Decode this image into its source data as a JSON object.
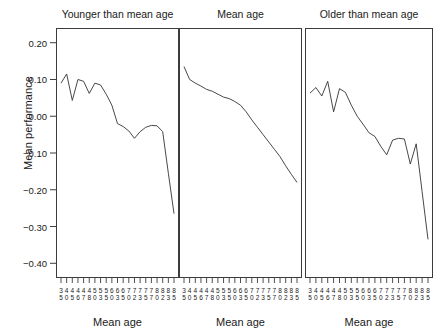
{
  "figure": {
    "ylabel": "Mean performance",
    "xlabel": "Mean age",
    "y_ticks": [
      "0.20",
      "0.10",
      "0.00",
      "-0.10",
      "-0.20",
      "-0.30",
      "-0.40"
    ],
    "x_ticks": [
      "35",
      "40",
      "45",
      "46",
      "47",
      "48",
      "50",
      "53",
      "55",
      "60",
      "63",
      "65",
      "70",
      "72",
      "73",
      "75",
      "77",
      "80",
      "82",
      "83",
      "85"
    ],
    "line_color": "#333333",
    "frame_color": "#3c3c3c",
    "background": "#ffffff"
  },
  "chart_data": [
    {
      "type": "line",
      "title": "Younger than mean age",
      "xlabel": "Mean age",
      "ylabel": "Mean performance",
      "ylim": [
        -0.44,
        0.24
      ],
      "grid": false,
      "legend": null,
      "x": [
        "35",
        "40",
        "45",
        "46",
        "47",
        "48",
        "50",
        "53",
        "55",
        "60",
        "63",
        "65",
        "70",
        "72",
        "73",
        "75",
        "77",
        "80",
        "82",
        "83",
        "85"
      ],
      "categories": [
        "35",
        "40",
        "45",
        "46",
        "47",
        "48",
        "50",
        "53",
        "55",
        "60",
        "63",
        "65",
        "70",
        "72",
        "73",
        "75",
        "77",
        "80",
        "82",
        "83",
        "85"
      ],
      "values": [
        0.09,
        0.115,
        0.043,
        0.1,
        0.095,
        0.062,
        0.09,
        0.085,
        0.06,
        0.03,
        -0.02,
        -0.028,
        -0.04,
        -0.06,
        -0.042,
        -0.03,
        -0.025,
        -0.026,
        -0.042,
        -0.155,
        -0.265
      ]
    },
    {
      "type": "line",
      "title": "Mean age",
      "xlabel": "Mean age",
      "ylabel": "Mean performance",
      "ylim": [
        -0.44,
        0.24
      ],
      "grid": false,
      "legend": null,
      "x": [
        "35",
        "40",
        "45",
        "46",
        "47",
        "48",
        "50",
        "53",
        "55",
        "60",
        "63",
        "65",
        "70",
        "72",
        "73",
        "75",
        "77",
        "80",
        "82",
        "83",
        "85"
      ],
      "categories": [
        "35",
        "40",
        "45",
        "46",
        "47",
        "48",
        "50",
        "53",
        "55",
        "60",
        "63",
        "65",
        "70",
        "72",
        "73",
        "75",
        "77",
        "80",
        "82",
        "83",
        "85"
      ],
      "values": [
        0.135,
        0.1,
        0.09,
        0.082,
        0.073,
        0.068,
        0.06,
        0.052,
        0.048,
        0.04,
        0.03,
        0.012,
        -0.01,
        -0.03,
        -0.05,
        -0.07,
        -0.09,
        -0.11,
        -0.135,
        -0.158,
        -0.18
      ]
    },
    {
      "type": "line",
      "title": "Older than mean age",
      "xlabel": "Mean age",
      "ylabel": "Mean performance",
      "ylim": [
        -0.44,
        0.24
      ],
      "grid": false,
      "legend": null,
      "x": [
        "35",
        "40",
        "45",
        "46",
        "47",
        "48",
        "50",
        "53",
        "55",
        "60",
        "63",
        "65",
        "70",
        "72",
        "73",
        "75",
        "77",
        "80",
        "82",
        "83",
        "85"
      ],
      "categories": [
        "35",
        "40",
        "45",
        "46",
        "47",
        "48",
        "50",
        "53",
        "55",
        "60",
        "63",
        "65",
        "70",
        "72",
        "73",
        "75",
        "77",
        "80",
        "82",
        "83",
        "85"
      ],
      "values": [
        0.063,
        0.078,
        0.055,
        0.095,
        0.012,
        0.075,
        0.065,
        0.03,
        0.0,
        -0.022,
        -0.045,
        -0.055,
        -0.082,
        -0.105,
        -0.065,
        -0.06,
        -0.062,
        -0.13,
        -0.075,
        -0.205,
        -0.335
      ]
    }
  ],
  "panels": [
    {
      "title": "Younger than mean age",
      "xlabel": "Mean age"
    },
    {
      "title": "Mean age",
      "xlabel": "Mean age"
    },
    {
      "title": "Older than mean age",
      "xlabel": "Mean age"
    }
  ]
}
